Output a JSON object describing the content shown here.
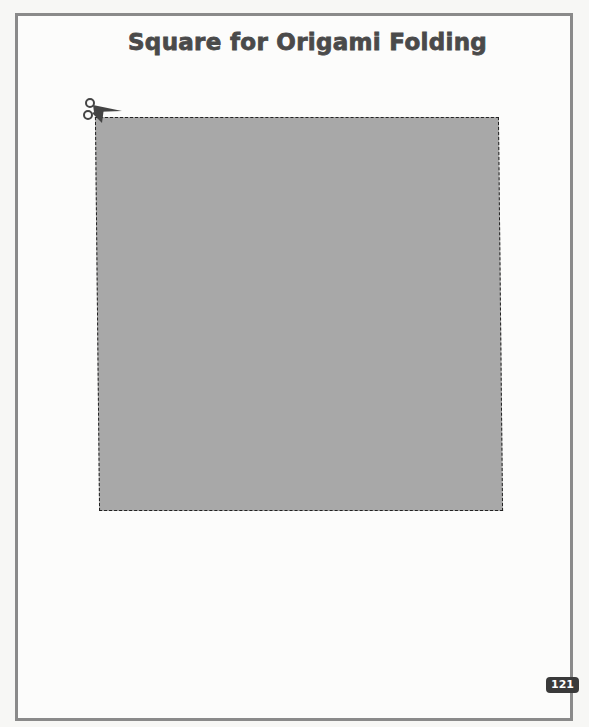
{
  "page": {
    "title": "Square for Origami Folding",
    "page_number": "121",
    "cut_icon": "scissors-icon",
    "square": {
      "fill": "#a8a8a8",
      "border": "dashed cut line"
    },
    "colors": {
      "frame": "#8a8a8a",
      "title": "#4a4a4a",
      "badge": "#3a3a3a"
    }
  }
}
